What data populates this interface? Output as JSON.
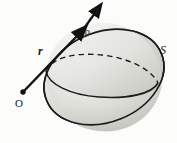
{
  "figure": {
    "kind": "vector-calculus-surface-diagram",
    "background_color": "#fcfcfa",
    "line_color": "#1a1a1a",
    "surface_fill_light": "#f2f2ef",
    "surface_fill_mid": "#d8d8d3",
    "surface_fill_dark": "#b9b9b3",
    "labels": {
      "normal_vector": "n",
      "position_vector": "r",
      "surface_point": "P",
      "origin": "O",
      "surface": "S"
    },
    "geometry": {
      "surface_center_x": 104,
      "surface_center_y": 77,
      "surface_radius_x": 62,
      "surface_radius_y": 45,
      "surface_rotation_deg": -22,
      "cross_section_center_x": 101,
      "cross_section_center_y": 76,
      "cross_section_radius_x": 58,
      "cross_section_radius_y": 21,
      "cross_section_rotation_deg": -8,
      "origin_x": 22,
      "origin_y": 93,
      "point_p_x": 80,
      "point_p_y": 33,
      "normal_tip_x": 93,
      "normal_tip_y": 11
    }
  }
}
